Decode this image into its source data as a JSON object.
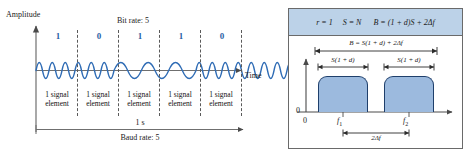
{
  "figure": {
    "title_left": "Bit rate: 5",
    "title_bottom_left": "Baud rate: 5"
  },
  "left_panel": {
    "y_axis_label": "Amplitude",
    "x_axis_label": "Time",
    "top_label": "Bit rate: 5",
    "duration_label": "1 s",
    "bottom_label": "Baud rate: 5",
    "bits": [
      "1",
      "0",
      "1",
      "1",
      "0"
    ],
    "element_label_line1": "1 signal",
    "element_label_line2": "element",
    "elements": [
      {
        "line1": "1 signal",
        "line2": "element"
      },
      {
        "line1": "1 signal",
        "line2": "element"
      },
      {
        "line1": "1 signal",
        "line2": "element"
      },
      {
        "line1": "1 signal",
        "line2": "element"
      },
      {
        "line1": "1 signal",
        "line2": "element"
      }
    ],
    "wave_color": "#2f6cb5",
    "bit_color": "#2a5fa5",
    "axis_color": "#6f6f6f"
  },
  "right_panel": {
    "formula_r": "r = 1",
    "formula_s": "S = N",
    "formula_b": "B = (1 + d)S + 2Δf",
    "bandwidth_label": "B = S(1 + d) + 2Δf",
    "lobe_label_left": "S(1 + d)",
    "lobe_label_right": "S(1 + d)",
    "y_origin_label": "0",
    "x_origin_label": "0",
    "carrier_left": "f",
    "carrier_left_sub": "1",
    "carrier_right": "f",
    "carrier_right_sub": "2",
    "separation_label": "2Δf",
    "header_bg": "#bcd2e8",
    "lobe_fill": "#9cbade",
    "lobe_stroke": "#1f3f6b",
    "border_color": "#6a6a6a"
  }
}
